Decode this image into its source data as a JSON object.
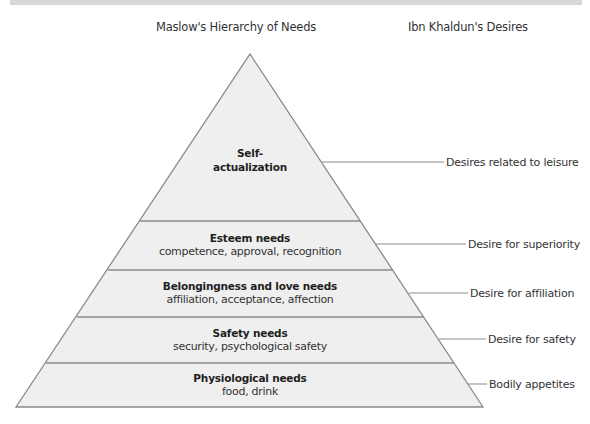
{
  "headings": {
    "maslow": "Maslow's Hierarchy of Needs",
    "khaldun": "Ibn Khaldun's Desires"
  },
  "colors": {
    "tier_fill": "#efefef",
    "outline": "#8a8a8a",
    "leader_line": "#8a8a8a",
    "top_band": "#d8d8d8"
  },
  "tiers": [
    {
      "title": "Self-",
      "title2": "actualization",
      "subtitle": ""
    },
    {
      "title": "Esteem needs",
      "subtitle": "competence, approval, recognition"
    },
    {
      "title": "Belongingness and love needs",
      "subtitle": "affiliation, acceptance, affection"
    },
    {
      "title": "Safety needs",
      "subtitle": "security, psychological safety"
    },
    {
      "title": "Physiological needs",
      "subtitle": "food, drink"
    }
  ],
  "desires": [
    {
      "label": "Desires related to leisure"
    },
    {
      "label": "Desire for superiority"
    },
    {
      "label": "Desire for affiliation"
    },
    {
      "label": "Desire for safety"
    },
    {
      "label": "Bodily appetites"
    }
  ]
}
